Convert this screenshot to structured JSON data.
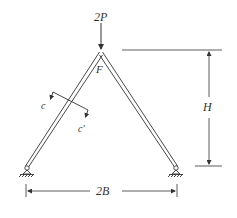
{
  "figure": {
    "type": "structural-frame-diagram",
    "colors": {
      "line": "#333333",
      "background": "#ffffff"
    }
  },
  "labels": {
    "load": "2P",
    "apex_joint": "F",
    "section_start": "c",
    "section_end": "c′",
    "height_dimension": "H",
    "span_dimension": "2B"
  },
  "elements": {
    "members": [
      "left-inclined-member",
      "right-inclined-member"
    ],
    "supports": [
      "left-pin-support",
      "right-pin-support"
    ],
    "load_arrow": {
      "direction": "down",
      "location": "apex",
      "magnitude_label": "2P"
    },
    "section_cut": {
      "member": "left-inclined-member",
      "from": "c",
      "to": "c′"
    },
    "dimensions": [
      {
        "label": "H",
        "orientation": "vertical",
        "from": "base",
        "to": "apex"
      },
      {
        "label": "2B",
        "orientation": "horizontal",
        "from": "left support",
        "to": "right support"
      }
    ]
  }
}
